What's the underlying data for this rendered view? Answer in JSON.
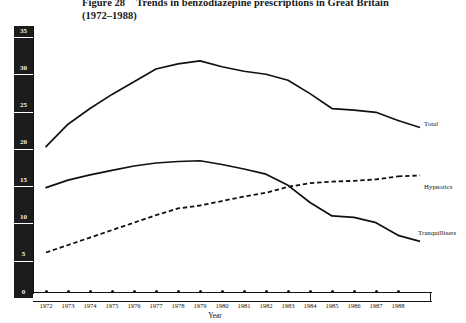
{
  "figure": {
    "number": "Figure 28",
    "caption": "Trends in benzodiazepine prescriptions in Great Britain",
    "subtitle": "(1972–1988)"
  },
  "axes": {
    "ylabel": "Benzodiazepine prescription items dispensed (millions)",
    "xlabel": "Year",
    "y_ticks": [
      "35",
      "30",
      "25",
      "20",
      "15",
      "10",
      "5",
      "0"
    ],
    "x_ticks": [
      "1972",
      "1973",
      "1974",
      "1975",
      "1976",
      "1977",
      "1978",
      "1979",
      "1980",
      "1981",
      "1982",
      "1983",
      "1984",
      "1985",
      "1986",
      "1987",
      "1988"
    ]
  },
  "series_labels": {
    "total": "Total",
    "hypnotics": "Hypnotics",
    "tranquillisers": "Tranquillisers"
  },
  "colors": {
    "ink": "#111111",
    "band": "#1c1c1c",
    "band_text": "#f2f2f2",
    "background": "#ffffff"
  },
  "chart_data": {
    "type": "line",
    "xlabel": "Year",
    "ylabel": "Benzodiazepine prescription items dispensed (millions)",
    "x": [
      1972,
      1973,
      1974,
      1975,
      1976,
      1977,
      1978,
      1979,
      1980,
      1981,
      1982,
      1983,
      1984,
      1985,
      1986,
      1987,
      1988
    ],
    "xlim": [
      1972,
      1988
    ],
    "ylim": [
      0,
      35
    ],
    "yticks": [
      0,
      5,
      10,
      15,
      20,
      25,
      30,
      35
    ],
    "grid": false,
    "legend": "right-inline-annotations",
    "series": [
      {
        "name": "Total",
        "style": "solid",
        "values": [
          19.5,
          22.5,
          24.6,
          26.5,
          28.2,
          29.9,
          30.6,
          31.0,
          30.2,
          29.6,
          29.2,
          28.4,
          26.6,
          24.6,
          24.4,
          24.1,
          23.0
        ]
      },
      {
        "name": "Hypnotics",
        "style": "dashed",
        "values": [
          5.3,
          6.3,
          7.3,
          8.3,
          9.3,
          10.3,
          11.2,
          11.6,
          12.2,
          12.8,
          13.3,
          14.1,
          14.6,
          14.8,
          14.9,
          15.1,
          15.5
        ]
      },
      {
        "name": "Tranquillisers",
        "style": "solid",
        "values": [
          14.0,
          15.0,
          15.7,
          16.3,
          16.9,
          17.3,
          17.5,
          17.6,
          17.1,
          16.5,
          15.8,
          14.3,
          12.0,
          10.2,
          10.0,
          9.3,
          7.6
        ]
      }
    ]
  }
}
